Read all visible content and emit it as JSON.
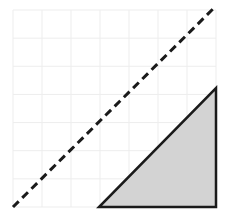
{
  "figure": {
    "title": "",
    "background_color": "#ffffff",
    "width": 227,
    "height": 219
  },
  "chart_data": {
    "type": "line",
    "title": "",
    "subtitle": "",
    "xlabel": "",
    "ylabel": "",
    "xlim": [
      0,
      7
    ],
    "ylim": [
      0,
      7
    ],
    "grid": true,
    "grid_color": "#ededed",
    "grid_divisions_x": 7,
    "grid_divisions_y": 7,
    "axis_tick_labels_x": [],
    "axis_tick_labels_y": [],
    "legend": null,
    "legend_position": "none",
    "annotations": [],
    "series": [
      {
        "name": "identity-line",
        "type": "line",
        "style": "dashed",
        "color": "#1a1a1a",
        "line_width": 3,
        "dash_pattern": "8 5",
        "x": [
          0,
          7
        ],
        "y": [
          0,
          7
        ]
      },
      {
        "name": "shaded-right-triangle",
        "type": "polygon",
        "fill_color": "#d3d3d3",
        "stroke_color": "#1a1a1a",
        "line_width": 2.5,
        "x": [
          3,
          7,
          7
        ],
        "y": [
          0,
          0,
          4
        ]
      }
    ]
  },
  "plot_geometry": {
    "grid_left": 13,
    "grid_right": 216,
    "grid_top": 10,
    "grid_bottom": 207,
    "grid_step": 29,
    "dashed_line": {
      "x1": 13,
      "y1": 207,
      "x2": 216,
      "y2": 6
    },
    "triangle_points": "99,207 216,207 216,88"
  }
}
